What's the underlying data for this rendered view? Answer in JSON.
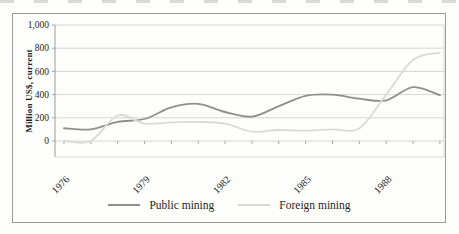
{
  "figure": {
    "y_axis_title": "Million US$, current",
    "legend_labels": [
      "Public mining",
      "Foreign mining"
    ]
  },
  "chart_data": {
    "type": "line",
    "title": "",
    "xlabel": "",
    "ylabel": "Million US$, current",
    "x": [
      1976,
      1977,
      1978,
      1979,
      1980,
      1981,
      1982,
      1983,
      1984,
      1985,
      1986,
      1987,
      1988,
      1989,
      1990
    ],
    "series": [
      {
        "name": "Public mining",
        "color": "#8f8f8f",
        "values": [
          110,
          100,
          165,
          190,
          290,
          320,
          250,
          210,
          300,
          390,
          400,
          365,
          350,
          465,
          395
        ]
      },
      {
        "name": "Foreign mining",
        "color": "#dadad8",
        "values": [
          0,
          0,
          220,
          150,
          160,
          165,
          150,
          80,
          95,
          90,
          100,
          110,
          400,
          700,
          760
        ]
      }
    ],
    "ylim": [
      0,
      1000
    ],
    "yticks": [
      0,
      200,
      400,
      600,
      800,
      1000
    ],
    "ytick_labels": [
      "0",
      "200",
      "400",
      "600",
      "800",
      "1,000"
    ],
    "xtick_years": [
      1976,
      1979,
      1982,
      1985,
      1988
    ],
    "xtick_labels": [
      "1976",
      "1979",
      "1982",
      "1985",
      "1988"
    ],
    "grid": true,
    "legend_position": "bottom",
    "smooth": true,
    "axis_color": "#9b9b9b",
    "grid_color": "#cbcbca",
    "tick_label_color": "#242424"
  }
}
